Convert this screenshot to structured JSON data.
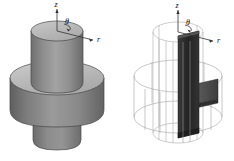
{
  "figure": {
    "background_color": "#ffffff",
    "panels": [
      {
        "id": "solid-body",
        "name": "solid-axisymmetric-body",
        "render_style": "shaded-solid",
        "description": "Shaded solid of revolution: flanged hub with upper cylinder, central disc flange and lower cylindrical boss",
        "axes": {
          "z": {
            "label": "z",
            "direction": "vertical-up"
          },
          "theta": {
            "label": "θ",
            "direction": "circumferential"
          },
          "r": {
            "label": "r",
            "direction": "radial-out-right"
          }
        },
        "colors": {
          "top_face": "#b4b4b4",
          "upper_cylinder": "#9c9c9c",
          "upper_cylinder_shadow": "#6e6e6e",
          "flange_top": "#c2c2c2",
          "flange_side": "#8a8a8a",
          "flange_shadow": "#5e5e5e",
          "lower_boss": "#8f8f8f",
          "outline": "#3a3a3a",
          "axis_line": "#333333"
        }
      },
      {
        "id": "wireframe-body",
        "name": "wireframe-revolution-mesh",
        "render_style": "wireframe-with-shaded-section",
        "description": "Same body shown as a wireframe surface of revolution with the dark generating cross-section plane highlighted",
        "axes": {
          "z": {
            "label": "z",
            "direction": "vertical-up"
          },
          "theta": {
            "label": "θ",
            "direction": "circumferential"
          },
          "r": {
            "label": "r",
            "direction": "radial-out-right"
          }
        },
        "colors": {
          "wire": "#9a9a9a",
          "wire_light": "#b8b8b8",
          "section_dark": "#2b2b2b",
          "section_mid": "#4a4a4a",
          "section_light": "#5f5f5f",
          "axis_line": "#333333"
        },
        "mesh": {
          "vertical_generator_count": 18,
          "horizontal_ring_count": 6
        }
      }
    ]
  }
}
